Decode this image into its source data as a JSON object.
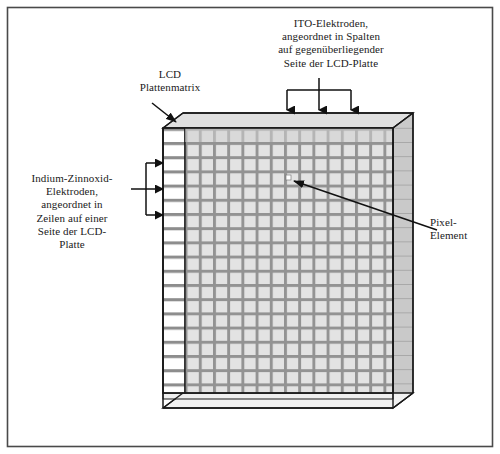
{
  "figure": {
    "kind": "lcd-panel-matrix-diagram",
    "frame_border_color": "#3a3a3a",
    "background_color": "#ffffff"
  },
  "labels": {
    "ito_columns": "ITO-Elektroden,\nangeordnet in Spalten\nauf gegenüberliegender\nSeite der LCD-Platte",
    "lcd_matrix": "LCD\nPlattenmatrix",
    "ito_rows": "Indium-Zinnoxid-\nElektroden,\nangeordnet in\nZeilen auf einer\nSeite der LCD-\nPlatte",
    "pixel_element": "Pixel-\nElement"
  },
  "panel": {
    "grid_columns": 17,
    "grid_rows": 20,
    "cell_fill": "#d9d9d9",
    "grid_line_color": "#8f8f8f",
    "outline_color": "#1a1a1a",
    "depth_face_fill": "#c6c6c6",
    "row_stub_fill": "#ffffff",
    "pixel_marker_fill": "#ffffff",
    "pixel_marker_label": "pixel-element-marker"
  },
  "annotations": {
    "column_arrows_count": 3,
    "row_arrows_count": 3,
    "lcd_matrix_arrow": "diagonal-arrow-down-right",
    "pixel_arrow": "diagonal-arrow-up-left"
  }
}
